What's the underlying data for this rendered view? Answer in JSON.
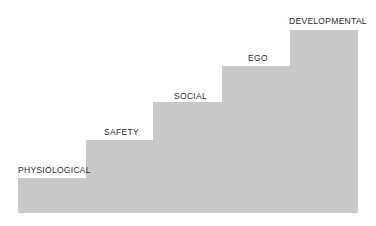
{
  "diagram": {
    "type": "staircase",
    "fill_color": "#c9c9c9",
    "steps": [
      {
        "label": "PHYSIOLOGICAL",
        "level": 1
      },
      {
        "label": "SAFETY",
        "level": 2
      },
      {
        "label": "SOCIAL",
        "level": 3
      },
      {
        "label": "EGO",
        "level": 4
      },
      {
        "label": "DEVELOPMENTAL",
        "level": 5
      }
    ]
  }
}
